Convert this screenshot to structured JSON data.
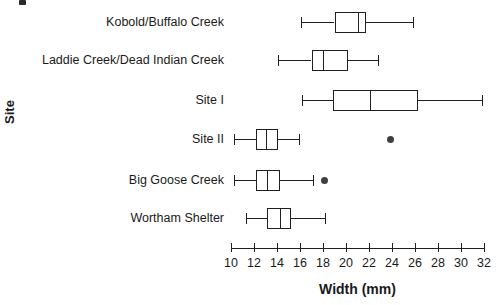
{
  "chart_data": {
    "type": "box",
    "title": "",
    "xlabel": "Width (mm)",
    "ylabel": "Site",
    "orientation": "horizontal",
    "xlim": [
      10,
      32
    ],
    "xticks": [
      10,
      12,
      14,
      16,
      18,
      20,
      22,
      24,
      26,
      28,
      30,
      32
    ],
    "xticklabels": [
      "10",
      "12",
      "14",
      "16",
      "18",
      "20",
      "22",
      "24",
      "26",
      "28",
      "30",
      "32"
    ],
    "grid": false,
    "legend": false,
    "categories": [
      "Kobold/Buffalo Creek",
      "Laddie Creek/Dead Indian Creek",
      "Site I",
      "Site II",
      "Big Goose Creek",
      "Wortham Shelter"
    ],
    "boxes": [
      {
        "category": "Kobold/Buffalo Creek",
        "whisker_low": 16.1,
        "q1": 19.0,
        "median": 21.0,
        "q3": 21.7,
        "whisker_high": 25.8,
        "outliers": []
      },
      {
        "category": "Laddie Creek/Dead Indian Creek",
        "whisker_low": 14.1,
        "q1": 17.0,
        "median": 18.0,
        "q3": 20.2,
        "whisker_high": 22.8,
        "outliers": []
      },
      {
        "category": "Site I",
        "whisker_low": 16.2,
        "q1": 18.9,
        "median": 22.1,
        "q3": 26.3,
        "whisker_high": 31.8,
        "outliers": []
      },
      {
        "category": "Site II",
        "whisker_low": 10.3,
        "q1": 12.2,
        "median": 13.0,
        "q3": 14.1,
        "whisker_high": 15.9,
        "outliers": [
          23.9
        ]
      },
      {
        "category": "Big Goose Creek",
        "whisker_low": 10.3,
        "q1": 12.2,
        "median": 13.1,
        "q3": 14.3,
        "whisker_high": 17.1,
        "outliers": [
          18.1
        ]
      },
      {
        "category": "Wortham Shelter",
        "whisker_low": 11.3,
        "q1": 13.1,
        "median": 14.3,
        "q3": 15.2,
        "whisker_high": 18.2,
        "outliers": []
      }
    ],
    "colors": {
      "line": "#231f20",
      "box_fill": "#ffffff",
      "outlier": "#3f3f42",
      "text": "#1a1a1a",
      "background": "#ffffff"
    }
  },
  "layout": {
    "axis_x_start_px": 231,
    "axis_x_end_px": 484,
    "axis_y_px": 248,
    "row_centers_px": [
      22,
      60,
      100,
      139,
      180,
      218
    ],
    "box_height_px": 21,
    "cap_height_px": 11
  }
}
